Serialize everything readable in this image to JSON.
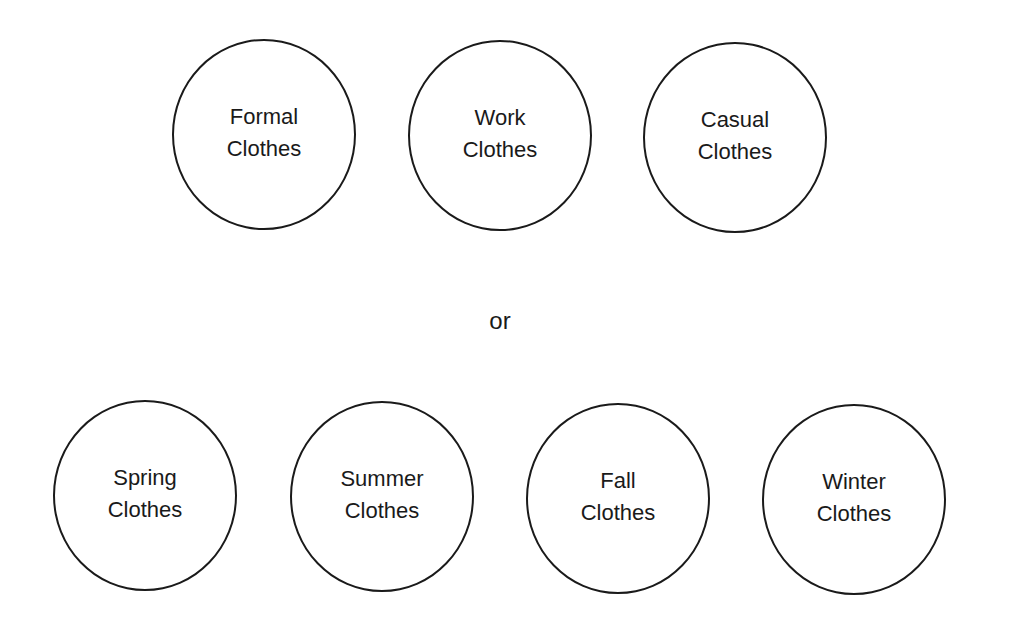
{
  "diagram": {
    "groups": [
      {
        "name": "by-occasion",
        "items": [
          {
            "line1": "Formal",
            "line2": "Clothes"
          },
          {
            "line1": "Work",
            "line2": "Clothes"
          },
          {
            "line1": "Casual",
            "line2": "Clothes"
          }
        ]
      },
      {
        "name": "by-season",
        "items": [
          {
            "line1": "Spring",
            "line2": "Clothes"
          },
          {
            "line1": "Summer",
            "line2": "Clothes"
          },
          {
            "line1": "Fall",
            "line2": "Clothes"
          },
          {
            "line1": "Winter",
            "line2": "Clothes"
          }
        ]
      }
    ],
    "connector": "or",
    "colors": {
      "stroke": "#1a1a1a",
      "background": "#ffffff"
    }
  }
}
